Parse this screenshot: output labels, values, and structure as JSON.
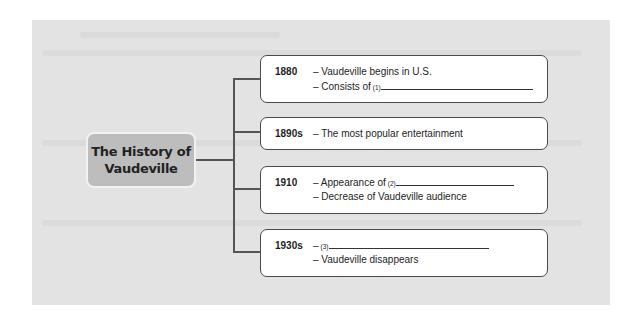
{
  "diagram": {
    "title": "The History of Vaudeville",
    "title_lines": [
      "The History of",
      "Vaudeville"
    ],
    "entries": [
      {
        "year": "1880",
        "items": [
          {
            "text": "– Vaudeville begins in U.S."
          },
          {
            "text": "– Consists of ",
            "blank_number": "(1)"
          }
        ]
      },
      {
        "year": "1890s",
        "items": [
          {
            "text": "– The most popular entertainment"
          }
        ]
      },
      {
        "year": "1910",
        "items": [
          {
            "text": "– Appearance of ",
            "blank_number": "(2)"
          },
          {
            "text": "– Decrease of Vaudeville audience"
          }
        ]
      },
      {
        "year": "1930s",
        "items": [
          {
            "text": "– ",
            "blank_number": "(3)"
          },
          {
            "text": "– Vaudeville disappears"
          }
        ]
      }
    ]
  },
  "colors": {
    "panel_background": "#e3e3e3",
    "title_box": "#bdbdbd",
    "box_border": "#4a4a4a",
    "connector": "#555555"
  }
}
